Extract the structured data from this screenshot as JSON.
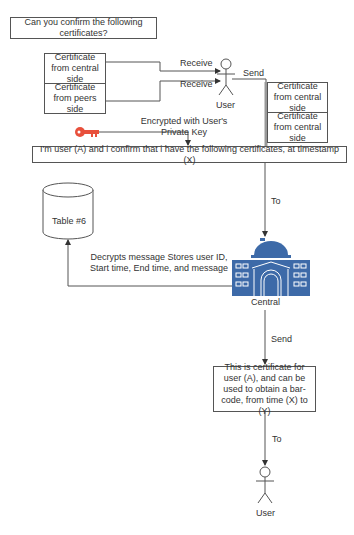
{
  "question_box": {
    "text": "Can you confirm the following certificates?"
  },
  "left_certificates": [
    {
      "text": "Certificate from central side"
    },
    {
      "text": "Certificate from peers side"
    }
  ],
  "right_certificates": [
    {
      "text": "Certificate from central side"
    },
    {
      "text": "Certificate from central side"
    }
  ],
  "edges": {
    "receive_1": "Receive",
    "receive_2": "Receive",
    "send_top": "Send",
    "encrypted": "Encrypted with User's Private Key",
    "to_central": "To",
    "decrypts": "Decrypts message Stores user ID, Start time, End time, and message",
    "send_bottom": "Send",
    "to_user": "To"
  },
  "actors": {
    "top_user": "User",
    "bottom_user": "User",
    "central": "Central"
  },
  "message_box": {
    "text": "I'm user (A) and i confirm that i have the following certificates, at timestamp (X)"
  },
  "database": {
    "label": "Table #6"
  },
  "certificate_box": {
    "text": "This is certificate for user (A), and can be used to obtain a bar-code, from time (X) to (Y)"
  },
  "colors": {
    "key": "#e8503c",
    "building": "#3d6aa8",
    "line": "#555555"
  }
}
